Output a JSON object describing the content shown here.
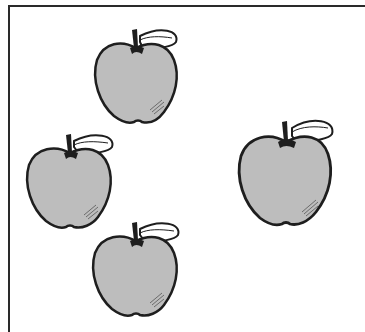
{
  "scene": {
    "description": "Four apples with leaves in a bordered frame",
    "apple_count": 4,
    "colors": {
      "apple_fill": "#bdbdbd",
      "outline": "#1e1e1e",
      "leaf_fill": "#ffffff",
      "frame": "#2a2a2a",
      "background": "#ffffff"
    },
    "apples": [
      {
        "id": "apple-top",
        "x": 92,
        "y": 20,
        "w": 90,
        "h": 108
      },
      {
        "id": "apple-left",
        "x": 24,
        "y": 127,
        "w": 92,
        "h": 106
      },
      {
        "id": "apple-bottom",
        "x": 90,
        "y": 213,
        "w": 92,
        "h": 108
      },
      {
        "id": "apple-right",
        "x": 236,
        "y": 112,
        "w": 100,
        "h": 120
      }
    ]
  }
}
